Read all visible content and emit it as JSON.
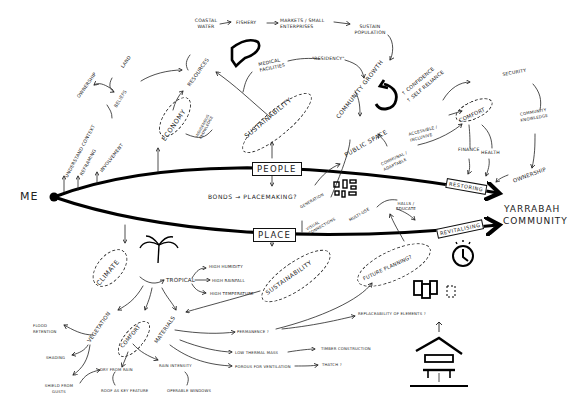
{
  "diagram": {
    "origin": "ME",
    "destination": [
      "YARRABAH",
      "COMMUNITY"
    ],
    "branches": {
      "people": "PEOPLE",
      "place": "PLACE"
    },
    "arrow_labels": {
      "restoring": "RESTORING",
      "revitalising": "REVITALISING"
    },
    "me_links": [
      "UNDERSTAND CONTEXT",
      "REFRAMING",
      "INVOLVEMENT"
    ],
    "beliefs": {
      "label": "BELIEFS",
      "children": [
        "OWNERSHIP",
        "LAND"
      ]
    },
    "economy": {
      "label": "ECONOMY",
      "children": [
        "RESOURCES",
        "INDIGENOUS KNOWLEDGE"
      ]
    },
    "top_chain": [
      "COASTAL WATER",
      "FISHERY",
      "MARKETS / SMALL ENTERPRISES",
      "SUSTAIN POPULATION"
    ],
    "medical": [
      "MEDICAL FACILITIES",
      "\"RESIDENCY\""
    ],
    "people_sustainability": "SUSTAINABILITY",
    "community_growth": {
      "label": "COMMUNITY GROWTH",
      "outcomes": [
        "↑ CONFIDENCE",
        "↑ SELF RELIANCE"
      ]
    },
    "public_space": {
      "label": "PUBLIC SPACE",
      "links": [
        "ACCESSIBLE / INCLUSIVE",
        "COMMUNAL / ADAPTABLE"
      ]
    },
    "comfort_top": {
      "label": "COMFORT",
      "children": [
        "SECURITY",
        "FINANCE",
        "HEALTH"
      ]
    },
    "community_knowledge": [
      "COMMUNITY",
      "KNOWLEDGE"
    ],
    "ownership_right": "OWNERSHIP",
    "bonds": [
      "BONDS",
      "→",
      "PLACEMAKING?"
    ],
    "connections": [
      "GENERATION",
      "VISUAL CONNECTIONS"
    ],
    "multi_use": "MULTI-USE",
    "halls": [
      "HALLS /",
      "EDUCATE"
    ],
    "future_planning": "FUTURE PLANNING?",
    "climate": {
      "label": "CLIMATE",
      "type": "TROPICAL",
      "conditions": [
        "HIGH HUMIDITY",
        "HIGH RAINFALL",
        "HIGH TEMPERATURE"
      ]
    },
    "place_sustainability": "SUSTAINABILITY",
    "vegetation": {
      "label": "VEGETATION",
      "children": [
        "FLOOD RETENTION",
        "SHADING",
        "SHIELD FROM GUSTS"
      ]
    },
    "comfort_bottom": {
      "label": "COMFORT",
      "children": [
        "DRY FROM RAIN",
        "ROOF AS KEY FEATURE",
        "RAIN INTENSITY",
        "OPERABLE WINDOWS"
      ]
    },
    "materials": {
      "label": "MATERIALS",
      "children": [
        "PERMANENCE ?",
        "LOW THERMAL MASS",
        "POROUS FOR VENTILATION"
      ],
      "outcomes": [
        "TIMBER CONSTRUCTION",
        "THATCH ?",
        "REPLACEABILITY OF ELEMENTS ?"
      ]
    }
  },
  "colors": {
    "ink": "#111111",
    "paper": "#ffffff"
  }
}
